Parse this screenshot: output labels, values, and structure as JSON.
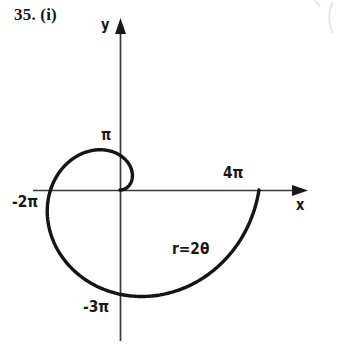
{
  "figure": {
    "problem_number": "35. (i)",
    "background_color": "#ffffff",
    "ink_color": "#18181a",
    "axis_color": "#3a3a3c",
    "axes": {
      "y_label": "y",
      "x_label": "x",
      "origin_px": [
        120,
        190
      ],
      "x_axis_span_px": [
        33,
        305
      ],
      "y_axis_span_px": [
        20,
        340
      ],
      "x_arrow": "right-arrowhead",
      "y_arrow": "up-arrowhead"
    },
    "tick_labels": {
      "pi": "π",
      "neg_two_pi": "-2π",
      "neg_three_pi": "-3π",
      "four_pi": "4π"
    },
    "curve_equation": "r=2θ"
  },
  "chart_data": {
    "type": "line",
    "title": "35. (i)",
    "subtype": "polar-spiral",
    "equation": "r=2θ",
    "xlabel": "x",
    "ylabel": "y",
    "grid": false,
    "legend": null,
    "polar": {
      "r_of_theta": "2*theta",
      "theta_start": 0,
      "theta_end": 6.283185307179586,
      "theta_units": "radians"
    },
    "annotations": [
      {
        "text": "π",
        "axis": "y",
        "value": 3.141592653589793,
        "note": "y-intercept of first quarter turn, theta = pi/2"
      },
      {
        "text": "-2π",
        "axis": "x",
        "value": -6.283185307179586,
        "note": "x-intercept at theta = pi"
      },
      {
        "text": "-3π",
        "axis": "y",
        "value": -9.42477796076938,
        "note": "y-intercept at theta = 3pi/2"
      },
      {
        "text": "4π",
        "axis": "x",
        "value": 12.566370614359172,
        "note": "x-intercept at theta = 2pi"
      },
      {
        "text": "r=2θ",
        "note": "curve equation label placed inside the lower right of the spiral"
      }
    ],
    "axis_crossings": [
      {
        "theta": 0.0,
        "r": 0.0,
        "x": 0.0,
        "y": 0.0,
        "label": "origin"
      },
      {
        "theta": 1.5707963267948966,
        "r": 3.141592653589793,
        "x": 0.0,
        "y": 3.141592653589793,
        "label": "π"
      },
      {
        "theta": 3.141592653589793,
        "r": 6.283185307179586,
        "x": -6.283185307179586,
        "y": 0.0,
        "label": "-2π"
      },
      {
        "theta": 4.71238898038469,
        "r": 9.42477796076938,
        "x": 0.0,
        "y": -9.42477796076938,
        "label": "-3π"
      },
      {
        "theta": 6.283185307179586,
        "r": 12.566370614359172,
        "x": 12.566370614359172,
        "y": 0.0,
        "label": "4π"
      }
    ],
    "x": [
      0.0,
      0.0,
      -6.283185307179586,
      0.0,
      12.566370614359172
    ],
    "y": [
      0.0,
      3.141592653589793,
      0.0,
      -9.42477796076938,
      0.0
    ],
    "xlim": [
      -8.5,
      13.5
    ],
    "ylim": [
      -10.5,
      5.5
    ]
  }
}
